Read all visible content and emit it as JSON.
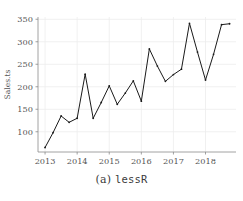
{
  "figure": {
    "caption_prefix": "(a)",
    "caption_name": "lessR"
  },
  "chart_data": {
    "type": "line",
    "title": "",
    "subtitle": "",
    "xlabel": "",
    "ylabel": "Sales.ts",
    "xlim": [
      2012.78,
      2018.95
    ],
    "ylim": [
      55,
      355
    ],
    "grid": true,
    "legend": false,
    "x_ticks": [
      2013,
      2014,
      2015,
      2016,
      2017,
      2018
    ],
    "x_tick_labels": [
      "2013",
      "2014",
      "2015",
      "2016",
      "2017",
      "2018"
    ],
    "y_ticks": [
      100,
      150,
      200,
      250,
      300,
      350
    ],
    "y_tick_labels": [
      "100",
      "150",
      "200",
      "250",
      "300",
      "350"
    ],
    "markers": true,
    "line_color": "#1a1a1a",
    "grid_color": "#ececec",
    "axis_color": "#8a8a8a",
    "series": [
      {
        "name": "Sales.ts",
        "x": [
          2013.0,
          2013.25,
          2013.5,
          2013.75,
          2014.0,
          2014.25,
          2014.5,
          2014.75,
          2015.0,
          2015.25,
          2015.5,
          2015.75,
          2016.0,
          2016.25,
          2016.5,
          2016.75,
          2017.0,
          2017.25,
          2017.5,
          2017.75,
          2018.0,
          2018.25,
          2018.5,
          2018.75
        ],
        "values": [
          65,
          98,
          135,
          121,
          130,
          228,
          130,
          165,
          202,
          161,
          186,
          213,
          168,
          284,
          246,
          212,
          227,
          239,
          341,
          277,
          215,
          272,
          338,
          340
        ]
      }
    ]
  }
}
